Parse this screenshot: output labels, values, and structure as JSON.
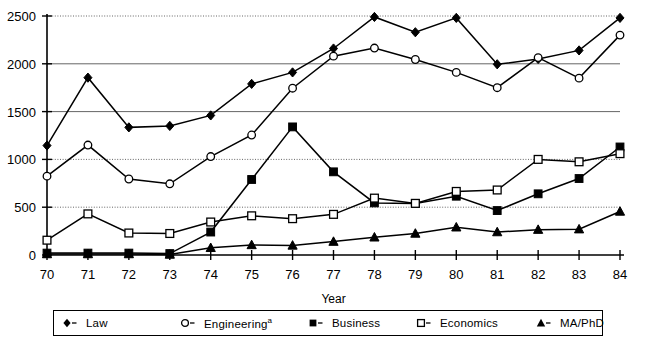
{
  "chart_data": {
    "type": "line",
    "title": "",
    "xlabel": "Year",
    "ylabel": "",
    "categories": [
      "70",
      "71",
      "72",
      "73",
      "74",
      "75",
      "76",
      "77",
      "78",
      "79",
      "80",
      "81",
      "82",
      "83",
      "84"
    ],
    "x": [
      70,
      71,
      72,
      73,
      74,
      75,
      76,
      77,
      78,
      79,
      80,
      81,
      82,
      83,
      84
    ],
    "ylim": [
      0,
      2500
    ],
    "yticks": [
      0,
      500,
      1000,
      1500,
      2000,
      2500
    ],
    "ytick_labels": [
      "0",
      "500",
      "1000",
      "1500",
      "2000",
      "2500"
    ],
    "grid": true,
    "grid_style": "dotted-horizontal",
    "legend_position": "bottom",
    "series": [
      {
        "name": "Law",
        "marker": "filled-diamond",
        "color": "#000000",
        "values": [
          1145,
          1855,
          1335,
          1350,
          1460,
          1790,
          1910,
          2160,
          2490,
          2330,
          2480,
          1995,
          2050,
          2140,
          2480
        ]
      },
      {
        "name": "Engineering",
        "name_superscript": "a",
        "marker": "open-circle",
        "color": "#000000",
        "values": [
          825,
          1150,
          795,
          745,
          1030,
          1255,
          1745,
          2080,
          2165,
          2045,
          1910,
          1750,
          2065,
          1850,
          2300
        ]
      },
      {
        "name": "Business",
        "marker": "filled-square",
        "color": "#000000",
        "values": [
          20,
          20,
          20,
          15,
          240,
          790,
          1340,
          870,
          545,
          540,
          615,
          465,
          640,
          800,
          1130
        ]
      },
      {
        "name": "Economics",
        "marker": "open-square",
        "color": "#000000",
        "values": [
          155,
          430,
          230,
          225,
          345,
          410,
          380,
          425,
          595,
          540,
          665,
          680,
          1000,
          975,
          1060
        ]
      },
      {
        "name": "MA/PhD",
        "marker": "filled-triangle",
        "color": "#000000",
        "values": [
          10,
          10,
          10,
          5,
          75,
          105,
          100,
          140,
          185,
          225,
          290,
          240,
          265,
          270,
          455
        ]
      }
    ]
  },
  "legend": {
    "items": [
      {
        "label": "Law",
        "sup": "",
        "marker": "filled-diamond"
      },
      {
        "label": "Engineering",
        "sup": "a",
        "marker": "open-circle"
      },
      {
        "label": "Business",
        "sup": "",
        "marker": "filled-square"
      },
      {
        "label": "Economics",
        "sup": "",
        "marker": "open-square"
      },
      {
        "label": "MA/PhD",
        "sup": "",
        "marker": "filled-triangle"
      }
    ]
  },
  "axes": {
    "x_title": "Year",
    "y_title": ""
  }
}
